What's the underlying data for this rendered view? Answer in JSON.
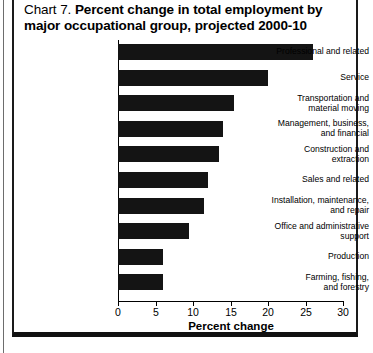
{
  "figure": {
    "chart_number": "Chart 7.",
    "title": "Percent change in total employment by major occupational group, projected 2000-10"
  },
  "chart_data": {
    "type": "bar",
    "orientation": "horizontal",
    "title": "Chart 7. Percent change in total employment by major occupational group, projected 2000-10",
    "xlabel": "Percent change",
    "ylabel": "",
    "xlim": [
      0,
      30
    ],
    "xticks": [
      "0",
      "5",
      "10",
      "15",
      "20",
      "25",
      "30"
    ],
    "xtick_values": [
      0,
      5,
      10,
      15,
      20,
      25,
      30
    ],
    "grid": false,
    "legend": null,
    "bar_color": "#141414",
    "categories": [
      "Professional and related",
      "Service",
      "Transportation and material moving",
      "Management, business, and financial",
      "Construction and extraction",
      "Sales and related",
      "Installation, maintenance, and repair",
      "Office and administrative support",
      "Production",
      "Farming, fishing, and forestry"
    ],
    "category_lines": [
      [
        "Professional and related"
      ],
      [
        "Service"
      ],
      [
        "Transportation and",
        "material moving"
      ],
      [
        "Management, business,",
        "and financial"
      ],
      [
        "Construction and",
        "extraction"
      ],
      [
        "Sales and related"
      ],
      [
        "Installation, maintenance,",
        "and repair"
      ],
      [
        "Office and administrative",
        "support"
      ],
      [
        "Production"
      ],
      [
        "Farming, fishing,",
        "and forestry"
      ]
    ],
    "values": [
      26,
      20,
      15.5,
      14,
      13.5,
      12,
      11.5,
      9.5,
      6,
      6
    ]
  }
}
